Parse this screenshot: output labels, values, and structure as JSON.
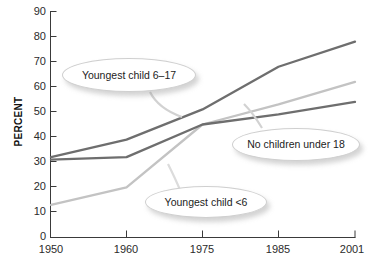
{
  "chart_data": {
    "type": "line",
    "title": "",
    "xlabel": "",
    "ylabel": "PERCENT",
    "grid": false,
    "legend_position": "inline-callouts",
    "x": [
      "1950",
      "1960",
      "1975",
      "1985",
      "2001"
    ],
    "xtick_labels": [
      "1950",
      "1960",
      "1975",
      "1985",
      "2001"
    ],
    "ytick_labels": [
      "0",
      "10",
      "20",
      "30",
      "40",
      "50",
      "60",
      "70",
      "80",
      "90"
    ],
    "ylim": [
      0,
      90
    ],
    "ytick_step": 10,
    "series": [
      {
        "name": "Youngest child 6-17",
        "label": "Youngest child 6–17",
        "color": "#6e6e6e",
        "values": [
          32,
          39,
          51,
          68,
          78
        ]
      },
      {
        "name": "Youngest child <6",
        "label": "Youngest child <6",
        "color": "#c3c3c3",
        "values": [
          13,
          20,
          45,
          53,
          62
        ]
      },
      {
        "name": "No children under 18",
        "label": "No children under 18",
        "color": "#6e6e6e",
        "values": [
          31,
          32,
          45,
          49,
          54
        ]
      }
    ],
    "annotations": [
      {
        "id": "callout-6to17",
        "text": "Youngest child 6–17",
        "points_to": "Youngest child 6-17"
      },
      {
        "id": "callout-none",
        "text": "No children under 18",
        "points_to": "No children under 18"
      },
      {
        "id": "callout-under6",
        "text": "Youngest child <6",
        "points_to": "Youngest child <6"
      }
    ]
  },
  "axes": {
    "y_axis_label": "PERCENT",
    "y_ticks": [
      "90",
      "80",
      "70",
      "60",
      "50",
      "40",
      "30",
      "20",
      "10",
      "0"
    ],
    "x_ticks": [
      "1950",
      "1960",
      "1975",
      "1985",
      "2001"
    ]
  },
  "colors": {
    "line_dark": "#6e6e6e",
    "line_light": "#c3c3c3",
    "axis": "#3a3a3a",
    "text": "#1c1c1c"
  }
}
